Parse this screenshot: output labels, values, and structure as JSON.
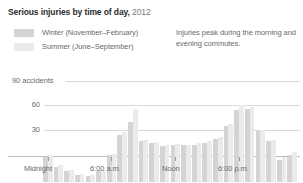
{
  "header": {
    "title_main": "Serious injuries by time of day,",
    "title_year": "2012"
  },
  "legend": {
    "items": [
      {
        "label": "Winter (November–February)",
        "color": "#d4d4d4"
      },
      {
        "label": "Summer (June–September)",
        "color": "#ebebeb"
      }
    ]
  },
  "annotation": {
    "text": "Injuries peak during the morning and evening commutes."
  },
  "chart_data": {
    "type": "bar",
    "title": "Serious injuries by time of day, 2012",
    "subtitle": "",
    "xlabel": "",
    "ylabel": "",
    "ylim": [
      0,
      100
    ],
    "grid": true,
    "legend_position": "top-left",
    "ytick_labels": [
      "90 accidents",
      "60",
      "30"
    ],
    "ytick_values": [
      90,
      60,
      30
    ],
    "xtick_labels": [
      "Midnight",
      "6:00 a.m.",
      "Noon",
      "6:00 p.m."
    ],
    "xtick_values": [
      0,
      6,
      12,
      18
    ],
    "categories": [
      "12 a.m.",
      "1 a.m.",
      "2 a.m.",
      "3 a.m.",
      "4 a.m.",
      "5 a.m.",
      "6 a.m.",
      "7 a.m.",
      "8 a.m.",
      "9 a.m.",
      "10 a.m.",
      "11 a.m.",
      "Noon",
      "1 p.m.",
      "2 p.m.",
      "3 p.m.",
      "4 p.m.",
      "5 p.m.",
      "6 p.m.",
      "7 p.m.",
      "8 p.m.",
      "9 p.m.",
      "10 p.m.",
      "11 p.m."
    ],
    "series": [
      {
        "name": "Winter (November–February)",
        "color": "#d4d4d4",
        "values": [
          30,
          18,
          13,
          9,
          7,
          13,
          32,
          57,
          72,
          49,
          47,
          43,
          45,
          44,
          45,
          47,
          52,
          67,
          86,
          88,
          61,
          49,
          27,
          33
        ]
      },
      {
        "name": "Summer (June–September)",
        "color": "#ebebeb",
        "values": [
          32,
          20,
          14,
          10,
          8,
          14,
          34,
          60,
          88,
          51,
          48,
          44,
          46,
          45,
          47,
          49,
          54,
          70,
          92,
          90,
          63,
          50,
          30,
          36
        ]
      }
    ],
    "annotations": [
      "Injuries peak during the morning and evening commutes."
    ]
  }
}
